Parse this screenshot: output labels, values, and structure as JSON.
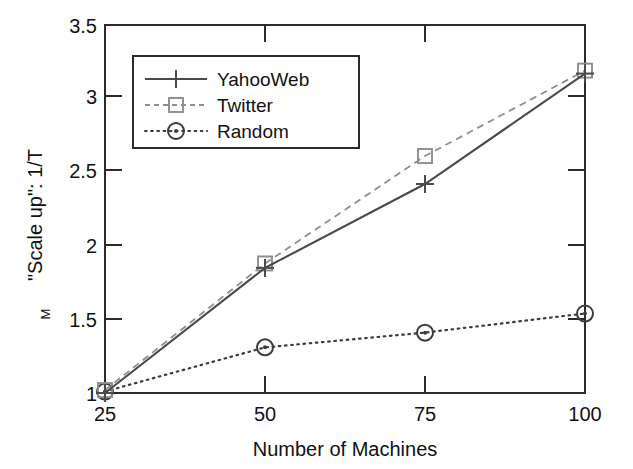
{
  "chart_data": {
    "type": "line",
    "title": "",
    "xlabel": "Number of Machines",
    "ylabel": "\"Scale up\":  1/T",
    "ylabel_subscript": "M",
    "x": [
      25,
      50,
      75,
      100
    ],
    "xtick_labels": [
      "25",
      "50",
      "75",
      "100"
    ],
    "ytick_labels": [
      "1",
      "1.5",
      "2",
      "2.5",
      "3",
      "3.5"
    ],
    "ytick_values": [
      1,
      1.5,
      2,
      2.5,
      3,
      3.5
    ],
    "xlim": [
      25,
      100
    ],
    "ylim": [
      1,
      3.5
    ],
    "grid": false,
    "legend_position": "upper left",
    "series": [
      {
        "name": "YahooWeb",
        "values": [
          1.0,
          1.85,
          2.42,
          3.17
        ],
        "linestyle": "solid",
        "marker": "plus",
        "color": "#4a4a4a"
      },
      {
        "name": "Twitter",
        "values": [
          1.02,
          1.88,
          2.61,
          3.19
        ],
        "linestyle": "dashed",
        "marker": "square",
        "color": "#8e8e8e"
      },
      {
        "name": "Random",
        "values": [
          1.01,
          1.31,
          1.41,
          1.54
        ],
        "linestyle": "dotted",
        "marker": "circle",
        "color": "#3c3c3c"
      }
    ]
  },
  "axes": {
    "x_tick_0": "25",
    "x_tick_1": "50",
    "x_tick_2": "75",
    "x_tick_3": "100",
    "y_tick_0": "1",
    "y_tick_1": "1.5",
    "y_tick_2": "2",
    "y_tick_3": "2.5",
    "y_tick_4": "3",
    "y_tick_5": "3.5",
    "x_title": "Number of Machines",
    "y_title_main": "\"Scale up\":  1/T",
    "y_title_sub": "M"
  },
  "legend": {
    "entry_0": "YahooWeb",
    "entry_1": "Twitter",
    "entry_2": "Random"
  }
}
